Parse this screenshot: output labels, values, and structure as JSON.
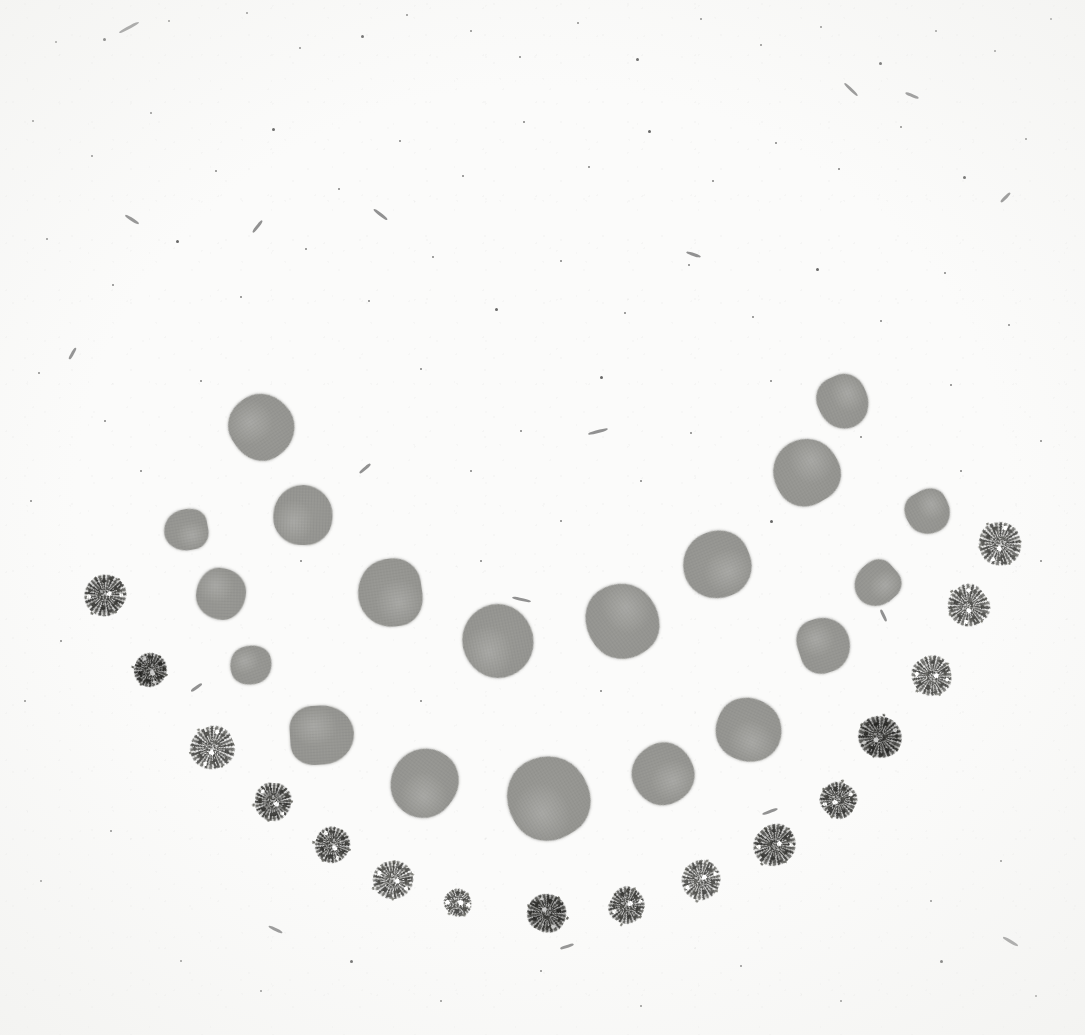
{
  "plate": {
    "title": "Dot Array Plate Scan",
    "width": 1085,
    "height": 1035,
    "background_color": "#fbfbfa",
    "smooth_dot_color": "#949490",
    "speckled_dot_color": "#50504d",
    "speck_color": "#2e2e2e"
  },
  "chart_data": {
    "type": "scatter",
    "subtitle": "",
    "xlabel": "",
    "ylabel": "",
    "xlim": [
      0,
      1085
    ],
    "ylim": [
      0,
      1035
    ],
    "grid": false,
    "legend_position": "none",
    "annotations": [],
    "series": [
      {
        "name": "inner-arc-smooth-dots",
        "marker": "smooth-blot",
        "color": "#949490",
        "count": 17,
        "points": [
          {
            "x": 262,
            "y": 427,
            "r": 32
          },
          {
            "x": 186,
            "y": 530,
            "r": 22
          },
          {
            "x": 303,
            "y": 515,
            "r": 30
          },
          {
            "x": 221,
            "y": 594,
            "r": 25
          },
          {
            "x": 390,
            "y": 593,
            "r": 32
          },
          {
            "x": 251,
            "y": 665,
            "r": 21
          },
          {
            "x": 498,
            "y": 641,
            "r": 37
          },
          {
            "x": 622,
            "y": 621,
            "r": 38
          },
          {
            "x": 322,
            "y": 735,
            "r": 32
          },
          {
            "x": 424,
            "y": 783,
            "r": 33
          },
          {
            "x": 548,
            "y": 798,
            "r": 42
          },
          {
            "x": 663,
            "y": 774,
            "r": 31
          },
          {
            "x": 749,
            "y": 730,
            "r": 33
          },
          {
            "x": 717,
            "y": 565,
            "r": 34
          },
          {
            "x": 824,
            "y": 645,
            "r": 26
          },
          {
            "x": 806,
            "y": 472,
            "r": 33
          },
          {
            "x": 843,
            "y": 402,
            "r": 27
          },
          {
            "x": 877,
            "y": 584,
            "r": 23
          },
          {
            "x": 928,
            "y": 512,
            "r": 22
          }
        ]
      },
      {
        "name": "outer-arc-speckled-dots",
        "marker": "granular-blot",
        "color": "#50504d",
        "count": 18,
        "points": [
          {
            "x": 105,
            "y": 595,
            "r": 20,
            "shade": "normal"
          },
          {
            "x": 150,
            "y": 670,
            "r": 17,
            "shade": "dark"
          },
          {
            "x": 212,
            "y": 748,
            "r": 22,
            "shade": "light"
          },
          {
            "x": 273,
            "y": 802,
            "r": 19,
            "shade": "normal"
          },
          {
            "x": 332,
            "y": 845,
            "r": 18,
            "shade": "normal"
          },
          {
            "x": 393,
            "y": 880,
            "r": 19,
            "shade": "light"
          },
          {
            "x": 458,
            "y": 903,
            "r": 14,
            "shade": "light"
          },
          {
            "x": 547,
            "y": 913,
            "r": 19,
            "shade": "dark"
          },
          {
            "x": 627,
            "y": 906,
            "r": 17,
            "shade": "normal"
          },
          {
            "x": 701,
            "y": 880,
            "r": 19,
            "shade": "light"
          },
          {
            "x": 775,
            "y": 845,
            "r": 20,
            "shade": "normal"
          },
          {
            "x": 838,
            "y": 800,
            "r": 18,
            "shade": "normal"
          },
          {
            "x": 880,
            "y": 737,
            "r": 22,
            "shade": "dark"
          },
          {
            "x": 932,
            "y": 676,
            "r": 20,
            "shade": "light"
          },
          {
            "x": 968,
            "y": 606,
            "r": 20,
            "shade": "light"
          },
          {
            "x": 1000,
            "y": 544,
            "r": 21,
            "shade": "light"
          }
        ]
      }
    ]
  },
  "artifacts": {
    "description": "scan specks and fibers on paper background",
    "specks": [
      {
        "x": 55,
        "y": 41,
        "s": 2
      },
      {
        "x": 103,
        "y": 38,
        "s": 3
      },
      {
        "x": 168,
        "y": 20,
        "s": 2
      },
      {
        "x": 246,
        "y": 12,
        "s": 2
      },
      {
        "x": 299,
        "y": 47,
        "s": 2
      },
      {
        "x": 361,
        "y": 35,
        "s": 3
      },
      {
        "x": 406,
        "y": 14,
        "s": 2
      },
      {
        "x": 470,
        "y": 30,
        "s": 2
      },
      {
        "x": 519,
        "y": 56,
        "s": 2
      },
      {
        "x": 577,
        "y": 22,
        "s": 2
      },
      {
        "x": 636,
        "y": 58,
        "s": 3
      },
      {
        "x": 700,
        "y": 18,
        "s": 2
      },
      {
        "x": 760,
        "y": 44,
        "s": 2
      },
      {
        "x": 820,
        "y": 26,
        "s": 2
      },
      {
        "x": 879,
        "y": 62,
        "s": 3
      },
      {
        "x": 935,
        "y": 30,
        "s": 2
      },
      {
        "x": 994,
        "y": 50,
        "s": 2
      },
      {
        "x": 1050,
        "y": 18,
        "s": 2
      },
      {
        "x": 32,
        "y": 120,
        "s": 2
      },
      {
        "x": 91,
        "y": 155,
        "s": 2
      },
      {
        "x": 150,
        "y": 112,
        "s": 2
      },
      {
        "x": 215,
        "y": 170,
        "s": 2
      },
      {
        "x": 272,
        "y": 128,
        "s": 3
      },
      {
        "x": 338,
        "y": 188,
        "s": 2
      },
      {
        "x": 399,
        "y": 140,
        "s": 2
      },
      {
        "x": 462,
        "y": 175,
        "s": 2
      },
      {
        "x": 523,
        "y": 121,
        "s": 2
      },
      {
        "x": 588,
        "y": 166,
        "s": 2
      },
      {
        "x": 648,
        "y": 130,
        "s": 3
      },
      {
        "x": 712,
        "y": 180,
        "s": 2
      },
      {
        "x": 775,
        "y": 142,
        "s": 2
      },
      {
        "x": 838,
        "y": 168,
        "s": 2
      },
      {
        "x": 900,
        "y": 126,
        "s": 2
      },
      {
        "x": 963,
        "y": 176,
        "s": 3
      },
      {
        "x": 1025,
        "y": 138,
        "s": 2
      },
      {
        "x": 46,
        "y": 238,
        "s": 2
      },
      {
        "x": 112,
        "y": 284,
        "s": 2
      },
      {
        "x": 176,
        "y": 240,
        "s": 3
      },
      {
        "x": 240,
        "y": 296,
        "s": 2
      },
      {
        "x": 305,
        "y": 248,
        "s": 2
      },
      {
        "x": 368,
        "y": 300,
        "s": 2
      },
      {
        "x": 432,
        "y": 256,
        "s": 2
      },
      {
        "x": 495,
        "y": 308,
        "s": 3
      },
      {
        "x": 560,
        "y": 260,
        "s": 2
      },
      {
        "x": 624,
        "y": 312,
        "s": 2
      },
      {
        "x": 688,
        "y": 264,
        "s": 2
      },
      {
        "x": 752,
        "y": 316,
        "s": 2
      },
      {
        "x": 816,
        "y": 268,
        "s": 3
      },
      {
        "x": 880,
        "y": 320,
        "s": 2
      },
      {
        "x": 944,
        "y": 272,
        "s": 2
      },
      {
        "x": 1008,
        "y": 324,
        "s": 2
      },
      {
        "x": 38,
        "y": 372,
        "s": 2
      },
      {
        "x": 104,
        "y": 420,
        "s": 2
      },
      {
        "x": 420,
        "y": 368,
        "s": 2
      },
      {
        "x": 520,
        "y": 430,
        "s": 2
      },
      {
        "x": 600,
        "y": 376,
        "s": 3
      },
      {
        "x": 690,
        "y": 432,
        "s": 2
      },
      {
        "x": 770,
        "y": 380,
        "s": 2
      },
      {
        "x": 860,
        "y": 436,
        "s": 2
      },
      {
        "x": 950,
        "y": 384,
        "s": 2
      },
      {
        "x": 1040,
        "y": 440,
        "s": 2
      },
      {
        "x": 30,
        "y": 500,
        "s": 2
      },
      {
        "x": 60,
        "y": 640,
        "s": 2
      },
      {
        "x": 140,
        "y": 470,
        "s": 2
      },
      {
        "x": 470,
        "y": 470,
        "s": 2
      },
      {
        "x": 560,
        "y": 520,
        "s": 2
      },
      {
        "x": 640,
        "y": 480,
        "s": 2
      },
      {
        "x": 770,
        "y": 520,
        "s": 3
      },
      {
        "x": 960,
        "y": 470,
        "s": 2
      },
      {
        "x": 1040,
        "y": 560,
        "s": 2
      },
      {
        "x": 24,
        "y": 700,
        "s": 2
      },
      {
        "x": 110,
        "y": 830,
        "s": 2
      },
      {
        "x": 40,
        "y": 880,
        "s": 2
      },
      {
        "x": 180,
        "y": 960,
        "s": 2
      },
      {
        "x": 260,
        "y": 990,
        "s": 2
      },
      {
        "x": 350,
        "y": 960,
        "s": 3
      },
      {
        "x": 440,
        "y": 1000,
        "s": 2
      },
      {
        "x": 540,
        "y": 970,
        "s": 2
      },
      {
        "x": 640,
        "y": 1005,
        "s": 2
      },
      {
        "x": 740,
        "y": 965,
        "s": 2
      },
      {
        "x": 840,
        "y": 1000,
        "s": 2
      },
      {
        "x": 940,
        "y": 960,
        "s": 3
      },
      {
        "x": 1035,
        "y": 995,
        "s": 2
      },
      {
        "x": 1000,
        "y": 860,
        "s": 2
      },
      {
        "x": 930,
        "y": 900,
        "s": 2
      },
      {
        "x": 300,
        "y": 560,
        "s": 2
      },
      {
        "x": 200,
        "y": 380,
        "s": 2
      },
      {
        "x": 420,
        "y": 700,
        "s": 2
      },
      {
        "x": 600,
        "y": 690,
        "s": 2
      },
      {
        "x": 480,
        "y": 560,
        "s": 2
      }
    ],
    "fibers": [
      {
        "x": 118,
        "y": 26,
        "w": 22,
        "h": 3,
        "rot": -28
      },
      {
        "x": 372,
        "y": 213,
        "w": 17,
        "h": 3,
        "rot": 38
      },
      {
        "x": 588,
        "y": 430,
        "w": 20,
        "h": 3,
        "rot": -15
      },
      {
        "x": 842,
        "y": 88,
        "w": 18,
        "h": 3,
        "rot": 44
      },
      {
        "x": 250,
        "y": 225,
        "w": 15,
        "h": 3,
        "rot": -52
      },
      {
        "x": 905,
        "y": 94,
        "w": 14,
        "h": 3,
        "rot": 22
      },
      {
        "x": 124,
        "y": 218,
        "w": 16,
        "h": 3,
        "rot": 33
      },
      {
        "x": 358,
        "y": 467,
        "w": 14,
        "h": 3,
        "rot": -40
      },
      {
        "x": 512,
        "y": 598,
        "w": 19,
        "h": 3,
        "rot": 12
      },
      {
        "x": 879,
        "y": 593,
        "w": 15,
        "h": 3,
        "rot": 70
      },
      {
        "x": 877,
        "y": 614,
        "w": 13,
        "h": 3,
        "rot": 65
      },
      {
        "x": 404,
        "y": 793,
        "w": 14,
        "h": 3,
        "rot": 55
      },
      {
        "x": 190,
        "y": 686,
        "w": 13,
        "h": 3,
        "rot": -35
      },
      {
        "x": 762,
        "y": 810,
        "w": 16,
        "h": 3,
        "rot": -20
      },
      {
        "x": 1002,
        "y": 940,
        "w": 17,
        "h": 3,
        "rot": 30
      },
      {
        "x": 66,
        "y": 352,
        "w": 13,
        "h": 3,
        "rot": -60
      },
      {
        "x": 686,
        "y": 253,
        "w": 15,
        "h": 3,
        "rot": 18
      },
      {
        "x": 999,
        "y": 196,
        "w": 13,
        "h": 3,
        "rot": -45
      },
      {
        "x": 268,
        "y": 928,
        "w": 15,
        "h": 3,
        "rot": 25
      },
      {
        "x": 560,
        "y": 945,
        "w": 14,
        "h": 3,
        "rot": -18
      }
    ]
  }
}
